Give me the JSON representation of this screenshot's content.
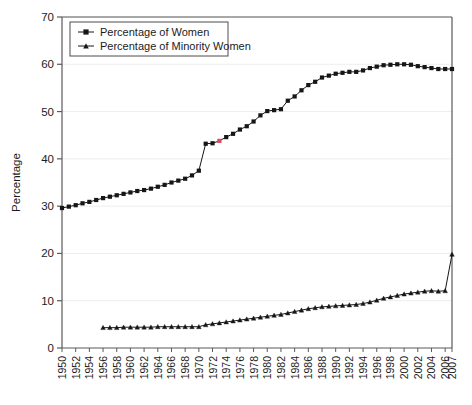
{
  "chart_data": {
    "type": "line",
    "title": "",
    "subtitle": "",
    "xlabel": "",
    "ylabel": "Percentage",
    "xlim": [
      1950,
      2007
    ],
    "ylim": [
      0,
      70
    ],
    "yticks": [
      0,
      10,
      20,
      30,
      40,
      50,
      60,
      70
    ],
    "xticks": [
      1950,
      1952,
      1954,
      1956,
      1958,
      1960,
      1962,
      1964,
      1966,
      1968,
      1970,
      1972,
      1974,
      1976,
      1978,
      1980,
      1982,
      1984,
      1986,
      1988,
      1990,
      1992,
      1994,
      1996,
      1998,
      2000,
      2002,
      2004,
      2006,
      2007
    ],
    "grid": "horizontal-faint",
    "legend_position": "top-left",
    "series": [
      {
        "name": "Percentage of Women",
        "marker": "square",
        "color": "#161616",
        "highlight_color": "#e04a5f",
        "highlight_points": [
          {
            "x": 1973,
            "y": 43.8
          }
        ],
        "x": [
          1950,
          1951,
          1952,
          1953,
          1954,
          1955,
          1956,
          1957,
          1958,
          1959,
          1960,
          1961,
          1962,
          1963,
          1964,
          1965,
          1966,
          1967,
          1968,
          1969,
          1970,
          1971,
          1972,
          1973,
          1974,
          1975,
          1976,
          1977,
          1978,
          1979,
          1980,
          1981,
          1982,
          1983,
          1984,
          1985,
          1986,
          1987,
          1988,
          1989,
          1990,
          1991,
          1992,
          1993,
          1994,
          1995,
          1996,
          1997,
          1998,
          1999,
          2000,
          2001,
          2002,
          2003,
          2004,
          2005,
          2006,
          2007
        ],
        "y": [
          29.6,
          29.9,
          30.2,
          30.6,
          30.9,
          31.3,
          31.7,
          32.0,
          32.3,
          32.6,
          32.9,
          33.2,
          33.4,
          33.7,
          34.1,
          34.5,
          35.0,
          35.4,
          35.8,
          36.5,
          37.5,
          43.2,
          43.3,
          43.8,
          44.6,
          45.3,
          46.2,
          46.9,
          47.9,
          49.2,
          50.1,
          50.3,
          50.5,
          52.3,
          53.2,
          54.5,
          55.6,
          56.3,
          57.2,
          57.6,
          58.0,
          58.2,
          58.4,
          58.4,
          58.7,
          59.2,
          59.5,
          59.8,
          59.9,
          60.0,
          60.0,
          59.9,
          59.6,
          59.4,
          59.2,
          59.0,
          59.0,
          59.0
        ]
      },
      {
        "name": "Percentage of Minority Women",
        "marker": "triangle",
        "color": "#161616",
        "x": [
          1956,
          1957,
          1958,
          1959,
          1960,
          1961,
          1962,
          1963,
          1964,
          1965,
          1966,
          1967,
          1968,
          1969,
          1970,
          1971,
          1972,
          1973,
          1974,
          1975,
          1976,
          1977,
          1978,
          1979,
          1980,
          1981,
          1982,
          1983,
          1984,
          1985,
          1986,
          1987,
          1988,
          1989,
          1990,
          1991,
          1992,
          1993,
          1994,
          1995,
          1996,
          1997,
          1998,
          1999,
          2000,
          2001,
          2002,
          2003,
          2004,
          2005,
          2006,
          2007
        ],
        "y": [
          4.3,
          4.3,
          4.3,
          4.4,
          4.4,
          4.4,
          4.4,
          4.4,
          4.5,
          4.5,
          4.5,
          4.5,
          4.5,
          4.5,
          4.5,
          4.9,
          5.1,
          5.3,
          5.5,
          5.7,
          5.9,
          6.1,
          6.3,
          6.5,
          6.7,
          6.9,
          7.1,
          7.4,
          7.7,
          8.0,
          8.3,
          8.5,
          8.7,
          8.8,
          8.9,
          9.0,
          9.1,
          9.2,
          9.4,
          9.7,
          10.1,
          10.5,
          10.8,
          11.1,
          11.4,
          11.6,
          11.8,
          12.0,
          12.1,
          12.0,
          12.1,
          19.8
        ]
      }
    ]
  },
  "legend": {
    "items": [
      {
        "label": "Percentage of Women"
      },
      {
        "label": "Percentage of Minority Women"
      }
    ]
  },
  "axis": {
    "ylabel": "Percentage"
  }
}
